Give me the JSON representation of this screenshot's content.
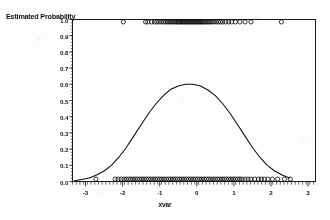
{
  "figure": {
    "background_color": "#fdfdfc",
    "ink_color": "#111111"
  },
  "axis": {
    "y_title": "Estimated Probability",
    "x_title": "xvar",
    "y_ticks": [
      "1.0",
      "0.9",
      "0.8",
      "0.7",
      "0.6",
      "0.5",
      "0.4",
      "0.3",
      "0.2",
      "0.1",
      "0.0"
    ],
    "x_ticks": [
      "-3",
      "-2",
      "-1",
      "0",
      "1",
      "2",
      "3"
    ]
  },
  "chart_data": {
    "type": "line",
    "title": "",
    "subtitle": "",
    "xlabel": "xvar",
    "ylabel": "Estimated Probability",
    "xlim": [
      -3.35,
      3.2
    ],
    "ylim": [
      0.0,
      1.0
    ],
    "xticks": [
      -3,
      -2,
      -1,
      0,
      1,
      2,
      3
    ],
    "yticks": [
      0.0,
      0.1,
      0.2,
      0.3,
      0.4,
      0.5,
      0.6,
      0.7,
      0.8,
      0.9,
      1.0
    ],
    "grid": false,
    "legend": "none",
    "series": [
      {
        "name": "fitted density curve",
        "type": "line",
        "note": "bell-shaped curve, peak 0.60 near x = -0.25",
        "peak_x": -0.25,
        "peak_y": 0.6,
        "x": [
          -3.3,
          -3.1,
          -2.9,
          -2.7,
          -2.5,
          -2.3,
          -2.1,
          -1.9,
          -1.7,
          -1.5,
          -1.3,
          -1.1,
          -0.9,
          -0.7,
          -0.5,
          -0.3,
          -0.1,
          0.1,
          0.3,
          0.5,
          0.7,
          0.9,
          1.1,
          1.3,
          1.5,
          1.7,
          1.9,
          2.1,
          2.3,
          2.5
        ],
        "y": [
          0.005,
          0.012,
          0.022,
          0.04,
          0.065,
          0.1,
          0.15,
          0.21,
          0.28,
          0.35,
          0.42,
          0.48,
          0.53,
          0.57,
          0.59,
          0.6,
          0.6,
          0.59,
          0.565,
          0.53,
          0.48,
          0.42,
          0.35,
          0.28,
          0.21,
          0.15,
          0.1,
          0.065,
          0.04,
          0.022
        ]
      },
      {
        "name": "observations y = 1",
        "type": "scatter",
        "marker": "open-circle",
        "y_value": 1.0,
        "x": [
          -1.98,
          -1.38,
          -1.32,
          -1.22,
          -1.14,
          -1.08,
          -1.02,
          -0.96,
          -0.9,
          -0.85,
          -0.8,
          -0.76,
          -0.72,
          -0.68,
          -0.64,
          -0.6,
          -0.56,
          -0.52,
          -0.49,
          -0.46,
          -0.43,
          -0.4,
          -0.37,
          -0.34,
          -0.31,
          -0.28,
          -0.25,
          -0.22,
          -0.19,
          -0.16,
          -0.13,
          -0.1,
          -0.07,
          -0.04,
          -0.01,
          0.02,
          0.05,
          0.08,
          0.11,
          0.14,
          0.17,
          0.2,
          0.24,
          0.28,
          0.32,
          0.36,
          0.41,
          0.46,
          0.52,
          0.58,
          0.64,
          0.7,
          0.78,
          0.86,
          0.94,
          1.04,
          1.16,
          1.3,
          1.46,
          2.28
        ]
      },
      {
        "name": "observations y = 0",
        "type": "scatter",
        "marker": "open-circle",
        "y_value": 0.0,
        "x": [
          -2.72,
          -2.2,
          -2.12,
          -2.04,
          -1.96,
          -1.9,
          -1.84,
          -1.78,
          -1.72,
          -1.66,
          -1.6,
          -1.54,
          -1.48,
          -1.42,
          -1.36,
          -1.3,
          -1.24,
          -1.18,
          -1.12,
          -1.06,
          -1.0,
          -0.94,
          -0.88,
          -0.82,
          -0.76,
          -0.7,
          -0.64,
          -0.58,
          -0.52,
          -0.46,
          -0.4,
          -0.34,
          -0.28,
          -0.22,
          -0.16,
          -0.1,
          -0.04,
          0.02,
          0.08,
          0.14,
          0.2,
          0.26,
          0.32,
          0.38,
          0.44,
          0.5,
          0.56,
          0.62,
          0.68,
          0.74,
          0.8,
          0.86,
          0.92,
          0.98,
          1.04,
          1.1,
          1.16,
          1.22,
          1.3,
          1.38,
          1.46,
          1.56,
          1.66,
          1.74,
          1.82,
          1.92,
          2.04,
          2.18,
          2.36,
          2.52
        ]
      }
    ]
  }
}
